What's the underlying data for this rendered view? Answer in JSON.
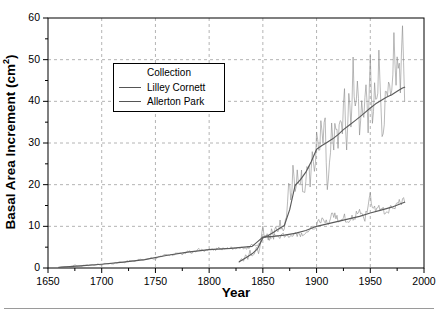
{
  "chart_data": {
    "type": "line",
    "title": "",
    "xlabel": "Year",
    "ylabel": "Basal Area Increment (cm2)",
    "ylabel_base": "Basal Area Increment (cm",
    "ylabel_sup": "2",
    "ylabel_tail": ")",
    "xlim": [
      1650,
      2000
    ],
    "ylim": [
      0,
      60
    ],
    "xticks": [
      1650,
      1700,
      1750,
      1800,
      1850,
      1900,
      1950,
      2000
    ],
    "xtick_labels": [
      "1650",
      "1700",
      "1750",
      "1800",
      "1850",
      "1900",
      "1950",
      "2000"
    ],
    "xminor_step": 25,
    "yticks": [
      0,
      10,
      20,
      30,
      40,
      50,
      60
    ],
    "ytick_labels": [
      "0",
      "10",
      "20",
      "30",
      "40",
      "50",
      "60"
    ],
    "yminor_step": 5,
    "grid": true,
    "grid_style": "dashed",
    "grid_color": "#b4b4b4",
    "legend": {
      "position": "upper-left-inside",
      "title": "Collection",
      "entries": [
        {
          "label": "Lilley Cornett",
          "color": "#6b6b6b"
        },
        {
          "label": "Allerton Park",
          "color": "#6b6b6b"
        }
      ]
    },
    "series": [
      {
        "name": "Lilley Cornett",
        "kind": "annual-noisy",
        "color": "#8a8a8a",
        "x_start": 1828,
        "x_end": 1982,
        "x": [
          1828,
          1830,
          1832,
          1834,
          1836,
          1838,
          1840,
          1842,
          1844,
          1846,
          1848,
          1850,
          1852,
          1854,
          1856,
          1858,
          1860,
          1862,
          1864,
          1866,
          1868,
          1870,
          1872,
          1874,
          1876,
          1878,
          1880,
          1882,
          1884,
          1886,
          1888,
          1890,
          1892,
          1894,
          1896,
          1898,
          1900,
          1902,
          1904,
          1906,
          1908,
          1910,
          1912,
          1914,
          1916,
          1918,
          1920,
          1922,
          1924,
          1926,
          1928,
          1930,
          1932,
          1934,
          1936,
          1938,
          1940,
          1942,
          1944,
          1946,
          1948,
          1950,
          1952,
          1954,
          1956,
          1958,
          1960,
          1962,
          1964,
          1966,
          1968,
          1970,
          1972,
          1974,
          1976,
          1978,
          1980,
          1982
        ],
        "y": [
          1.2,
          2.4,
          1.6,
          3.1,
          2.2,
          4.0,
          2.8,
          3.4,
          5.0,
          3.6,
          6.4,
          9.8,
          7.0,
          8.6,
          6.2,
          9.4,
          7.4,
          10.6,
          8.4,
          11.2,
          9.0,
          10.0,
          12.2,
          21.5,
          16.0,
          23.2,
          18.0,
          24.0,
          19.4,
          22.0,
          17.6,
          20.8,
          24.6,
          21.0,
          26.5,
          23.0,
          30.5,
          28.0,
          33.5,
          30.0,
          35.0,
          18.5,
          26.0,
          33.0,
          28.5,
          36.0,
          30.5,
          38.0,
          32.0,
          41.0,
          29.0,
          44.0,
          33.0,
          51.0,
          37.0,
          45.5,
          33.5,
          41.0,
          35.0,
          44.5,
          33.0,
          50.0,
          37.0,
          44.0,
          38.0,
          49.5,
          36.0,
          30.0,
          43.0,
          38.5,
          46.0,
          40.0,
          56.0,
          43.0,
          51.0,
          45.0,
          59.0,
          40.0
        ]
      },
      {
        "name": "Lilley Cornett trend",
        "kind": "smoothed",
        "color": "#5a5a5a",
        "x": [
          1828,
          1835,
          1840,
          1845,
          1850,
          1855,
          1860,
          1865,
          1870,
          1875,
          1880,
          1885,
          1890,
          1895,
          1900,
          1905,
          1910,
          1915,
          1920,
          1925,
          1930,
          1935,
          1940,
          1945,
          1950,
          1955,
          1960,
          1965,
          1970,
          1975,
          1980,
          1982
        ],
        "y": [
          1.5,
          2.6,
          3.4,
          4.6,
          7.2,
          7.8,
          8.6,
          9.4,
          10.2,
          14.0,
          19.8,
          21.2,
          23.0,
          25.5,
          28.5,
          29.4,
          30.2,
          31.0,
          32.0,
          33.2,
          34.2,
          35.2,
          36.2,
          37.3,
          38.4,
          39.4,
          40.2,
          41.0,
          41.6,
          42.4,
          43.2,
          43.4
        ]
      },
      {
        "name": "Allerton Park",
        "kind": "annual-noisy",
        "color": "#8a8a8a",
        "x_start": 1660,
        "x_end": 1982,
        "x": [
          1660,
          1665,
          1670,
          1675,
          1680,
          1685,
          1690,
          1695,
          1700,
          1705,
          1710,
          1715,
          1720,
          1725,
          1730,
          1735,
          1740,
          1745,
          1750,
          1755,
          1760,
          1765,
          1770,
          1775,
          1780,
          1785,
          1790,
          1795,
          1800,
          1805,
          1810,
          1815,
          1820,
          1825,
          1830,
          1835,
          1840,
          1845,
          1850,
          1855,
          1860,
          1865,
          1870,
          1875,
          1880,
          1885,
          1890,
          1895,
          1900,
          1905,
          1910,
          1915,
          1920,
          1925,
          1930,
          1935,
          1940,
          1945,
          1950,
          1955,
          1960,
          1965,
          1970,
          1975,
          1980,
          1982
        ],
        "y": [
          0.1,
          0.2,
          0.3,
          0.6,
          0.5,
          0.7,
          0.6,
          0.9,
          0.8,
          1.1,
          1.0,
          1.4,
          1.3,
          1.7,
          1.6,
          2.0,
          1.9,
          2.4,
          2.2,
          2.8,
          3.2,
          3.0,
          3.6,
          3.3,
          4.0,
          3.7,
          4.4,
          4.1,
          4.6,
          4.3,
          4.8,
          4.4,
          4.9,
          4.6,
          5.0,
          4.7,
          5.4,
          5.0,
          7.8,
          7.2,
          7.8,
          7.0,
          8.0,
          7.4,
          8.2,
          7.8,
          8.6,
          9.4,
          10.4,
          11.6,
          10.8,
          13.0,
          11.4,
          12.6,
          11.0,
          12.4,
          13.6,
          11.8,
          17.5,
          13.0,
          14.6,
          12.8,
          14.2,
          15.4,
          16.2,
          15.8
        ]
      },
      {
        "name": "Allerton Park trend",
        "kind": "smoothed",
        "color": "#5a5a5a",
        "x": [
          1660,
          1680,
          1700,
          1720,
          1740,
          1760,
          1780,
          1800,
          1820,
          1840,
          1850,
          1860,
          1870,
          1880,
          1890,
          1900,
          1910,
          1920,
          1930,
          1940,
          1950,
          1960,
          1970,
          1980,
          1982
        ],
        "y": [
          0.15,
          0.5,
          0.9,
          1.4,
          2.0,
          3.0,
          3.8,
          4.4,
          4.7,
          5.2,
          7.4,
          7.6,
          7.9,
          8.3,
          9.0,
          10.0,
          10.6,
          11.2,
          11.8,
          12.4,
          13.2,
          13.9,
          14.6,
          15.6,
          15.8
        ]
      }
    ]
  }
}
